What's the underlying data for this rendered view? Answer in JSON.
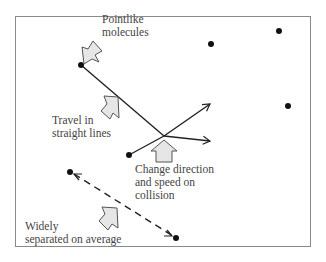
{
  "diagram": {
    "labels": {
      "pointlike": "Pointlike\nmolecules",
      "straight": "Travel in\nstraight lines",
      "collision": "Change direction\nand speed on\ncollision",
      "separated": "Widely\nseparated on average"
    },
    "colors": {
      "frame": "#8a8a8a",
      "line": "#222222",
      "dot": "#111111",
      "arrow_fill": "#e6e6e6",
      "arrow_stroke": "#555555",
      "text": "#444444"
    },
    "molecules": [
      {
        "x": 81,
        "y": 65
      },
      {
        "x": 211,
        "y": 44
      },
      {
        "x": 279,
        "y": 31
      },
      {
        "x": 288,
        "y": 106
      },
      {
        "x": 129,
        "y": 155
      },
      {
        "x": 70,
        "y": 172
      },
      {
        "x": 176,
        "y": 238
      }
    ],
    "collision_point": {
      "x": 164,
      "y": 136
    }
  }
}
